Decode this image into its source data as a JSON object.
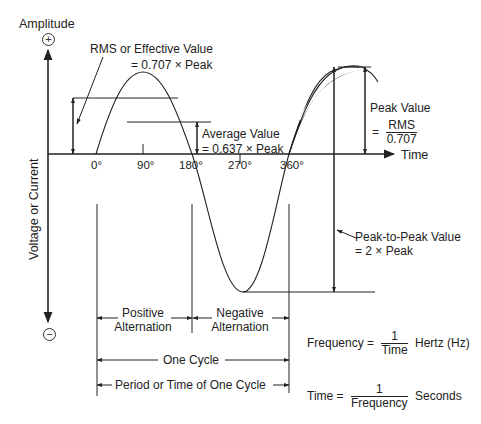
{
  "axes": {
    "y_axis_title": "Amplitude",
    "y_axis_label": "Voltage or Current",
    "positive_symbol": "+",
    "negative_symbol": "−",
    "x_axis_label": "Time",
    "ticks": [
      "0°",
      "90°",
      "180°",
      "270°",
      "360°"
    ]
  },
  "annotations": {
    "rms_title": "RMS or Effective Value",
    "rms_formula": "= 0.707 × Peak",
    "average_title": "Average Value",
    "average_formula": "= 0.637 × Peak",
    "peak_title": "Peak Value",
    "peak_eq": "=",
    "peak_num": "RMS",
    "peak_den": "0.707",
    "p2p_title": "Peak-to-Peak Value",
    "p2p_formula": "= 2 × Peak"
  },
  "spans": {
    "positive": [
      "Positive",
      "Alternation"
    ],
    "negative": [
      "Negative",
      "Alternation"
    ],
    "one_cycle": "One Cycle",
    "period": "Period or Time of One Cycle"
  },
  "formulas": {
    "frequency": {
      "lhs": "Frequency =",
      "num": "1",
      "den": "Time",
      "unit": "Hertz (Hz)"
    },
    "time": {
      "lhs": "Time =",
      "num": "1",
      "den": "Frequency",
      "unit": "Seconds"
    }
  },
  "colors": {
    "stroke": "#222222",
    "background": "#ffffff"
  }
}
